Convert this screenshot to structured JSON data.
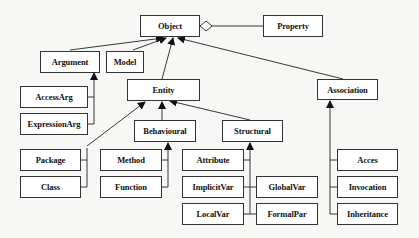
{
  "diagram": {
    "type": "UML class hierarchy",
    "nodes": {
      "object": "Object",
      "property": "Property",
      "argument": "Argument",
      "model": "Model",
      "entity": "Entity",
      "association": "Association",
      "access_arg": "AccessArg",
      "expression_arg": "ExpressionArg",
      "behavioural": "Behavioural",
      "structural": "Structural",
      "package": "Package",
      "class": "Class",
      "method": "Method",
      "function": "Function",
      "attribute": "Attribute",
      "implicit_var": "ImplicitVar",
      "global_var": "GlobalVar",
      "local_var": "LocalVar",
      "formal_par": "FormalPar",
      "acces": "Acces",
      "invocation": "Invocation",
      "inheritance": "Inheritance"
    },
    "edges": [
      {
        "from": "Object",
        "to": "Property",
        "kind": "aggregation"
      },
      {
        "from": "Argument",
        "to": "Object",
        "kind": "inheritance"
      },
      {
        "from": "Model",
        "to": "Object",
        "kind": "inheritance"
      },
      {
        "from": "Entity",
        "to": "Object",
        "kind": "inheritance"
      },
      {
        "from": "Association",
        "to": "Object",
        "kind": "inheritance"
      },
      {
        "from": "AccessArg",
        "to": "Argument",
        "kind": "inheritance"
      },
      {
        "from": "ExpressionArg",
        "to": "Argument",
        "kind": "inheritance"
      },
      {
        "from": "Package",
        "to": "Entity",
        "kind": "inheritance"
      },
      {
        "from": "Class",
        "to": "Package",
        "kind": "inheritance"
      },
      {
        "from": "Behavioural",
        "to": "Entity",
        "kind": "inheritance"
      },
      {
        "from": "Structural",
        "to": "Entity",
        "kind": "inheritance"
      },
      {
        "from": "Method",
        "to": "Behavioural",
        "kind": "inheritance"
      },
      {
        "from": "Function",
        "to": "Behavioural",
        "kind": "inheritance"
      },
      {
        "from": "Attribute",
        "to": "Structural",
        "kind": "inheritance"
      },
      {
        "from": "ImplicitVar",
        "to": "Structural",
        "kind": "inheritance"
      },
      {
        "from": "GlobalVar",
        "to": "Structural",
        "kind": "inheritance"
      },
      {
        "from": "LocalVar",
        "to": "Structural",
        "kind": "inheritance"
      },
      {
        "from": "FormalPar",
        "to": "Structural",
        "kind": "inheritance"
      },
      {
        "from": "Acces",
        "to": "Association",
        "kind": "inheritance"
      },
      {
        "from": "Invocation",
        "to": "Association",
        "kind": "inheritance"
      },
      {
        "from": "Inheritance",
        "to": "Association",
        "kind": "inheritance"
      }
    ]
  }
}
